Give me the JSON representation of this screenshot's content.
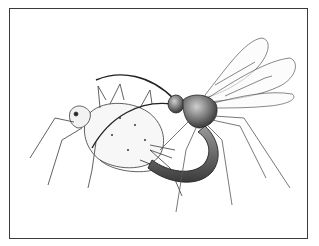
{
  "illustration": {
    "subject": "parasitoid wasp ovipositing into host insect",
    "style": "pen-and-ink line drawing",
    "colors": {
      "background": "#ffffff",
      "border": "#3a3a3a",
      "ink": "#2a2a2a",
      "shading": "#555555"
    }
  }
}
